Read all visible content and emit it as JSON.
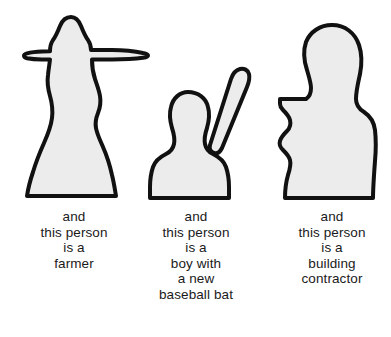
{
  "page": {
    "background_color": "#ffffff",
    "figure_fill_color": "#ececec",
    "figure_outline_color": "#111111",
    "text_color": "#1a1a1a"
  },
  "figures": [
    {
      "id": "farmer",
      "name": "farmer-silhouette",
      "description": "standing person wearing a wide-brimmed hat, body widening toward the base"
    },
    {
      "id": "boy",
      "name": "boy-with-bat-silhouette",
      "description": "smaller person with rounded head holding a baseball bat angled up to the right"
    },
    {
      "id": "contractor",
      "name": "building-contractor-silhouette",
      "description": "large person with broad shoulders and bent arm, torso cropped at the bottom"
    }
  ],
  "captions": [
    {
      "id": "farmer",
      "lines": [
        "and",
        "this person",
        "is a",
        "farmer"
      ]
    },
    {
      "id": "boy",
      "lines": [
        "and",
        "this person",
        "is a",
        "boy with",
        "a new",
        "baseball bat"
      ]
    },
    {
      "id": "contractor",
      "lines": [
        "and",
        "this person",
        "is a",
        "building",
        "contractor"
      ]
    }
  ]
}
